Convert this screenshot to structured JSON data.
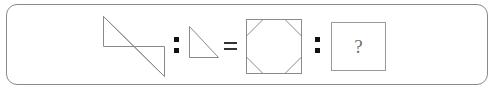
{
  "puzzle": {
    "type": "visual-analogy",
    "statement": "A : B = C : ?",
    "panel": {
      "border_color": "#8a8a8a",
      "background_color": "#ffffff",
      "corner_radius": 11
    },
    "stroke_color": "#8a8a8a",
    "operator_color": "#111111",
    "terms": [
      {
        "position": 1,
        "name": "z-shape-double-triangle",
        "label": "Z-shaped figure of two joined right triangles",
        "description": "Upper-left right triangle and lower-right right triangle meeting at a shared diagonal"
      },
      {
        "position": 2,
        "name": "right-triangle",
        "label": "Right triangle",
        "description": "Right triangle with vertical left leg, horizontal bottom leg and hypotenuse from top-left to bottom-right"
      },
      {
        "position": 3,
        "name": "octagon-in-square",
        "label": "Square with cut corners forming an octagon",
        "description": "Square outline whose four corners are crossed by diagonal chords, creating an inscribed octagon"
      },
      {
        "position": 4,
        "name": "answer-box",
        "label": "?",
        "description": "Empty answer box containing a question mark"
      }
    ],
    "operators": [
      {
        "name": "ratio-colon-1",
        "symbol": ":"
      },
      {
        "name": "equals-sign",
        "symbol": "="
      },
      {
        "name": "ratio-colon-2",
        "symbol": ":"
      }
    ],
    "answer_placeholder": "?"
  }
}
